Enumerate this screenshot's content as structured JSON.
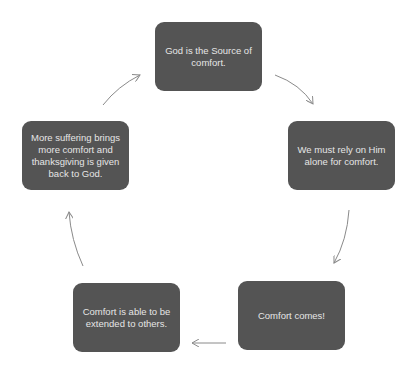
{
  "diagram": {
    "type": "cycle",
    "nodes": [
      {
        "id": "n1",
        "label": "God is the Source of comfort.",
        "x": 155,
        "y": 22
      },
      {
        "id": "n2",
        "label": "We must rely on Him alone for comfort.",
        "x": 288,
        "y": 121
      },
      {
        "id": "n3",
        "label": "Comfort comes!",
        "x": 238,
        "y": 281
      },
      {
        "id": "n4",
        "label": "Comfort is able to be extended to others.",
        "x": 73,
        "y": 283
      },
      {
        "id": "n5",
        "label": "More suffering brings more comfort and thanksgiving is given back to God.",
        "x": 22,
        "y": 121
      }
    ],
    "edges": [
      {
        "from": "n1",
        "to": "n2"
      },
      {
        "from": "n2",
        "to": "n3"
      },
      {
        "from": "n3",
        "to": "n4"
      },
      {
        "from": "n4",
        "to": "n5"
      },
      {
        "from": "n5",
        "to": "n1"
      }
    ],
    "colors": {
      "node_fill": "#545454",
      "node_text": "#e6e6e6",
      "arrow": "#8a8a8a"
    }
  }
}
